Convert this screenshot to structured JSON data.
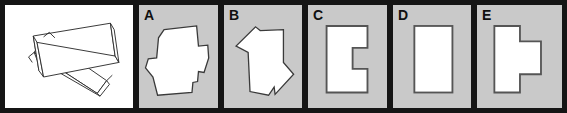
{
  "item": {
    "type": "spatial-reasoning-multiple-choice",
    "stimulus_label": "",
    "panel_count": 6
  },
  "colors": {
    "page_background": "#ffffff",
    "panel_border": "#151515",
    "option_background": "#c9c9c9",
    "shape_fill": "#ffffff",
    "shape_outline": "#3a3a3a",
    "stimulus_outline": "#2b2b2b",
    "label_text": "#101010"
  },
  "panels": [
    {
      "id": "stimulus",
      "label": "",
      "background": "#ffffff",
      "description": "two overlapping tilted flat rectangular sheets drawn in line art with visible thickness"
    },
    {
      "id": "option-a",
      "label": "A",
      "background": "#c9c9c9",
      "description": "irregular cross-like polygon with stepped notches, white fill on gray"
    },
    {
      "id": "option-b",
      "label": "B",
      "background": "#c9c9c9",
      "description": "tall angled polygon with pointed left shoulder and bottom notch, white fill on gray"
    },
    {
      "id": "option-c",
      "label": "C",
      "background": "#c9c9c9",
      "description": "upright rectangle with a square bite removed from the right edge, white fill on gray"
    },
    {
      "id": "option-d",
      "label": "D",
      "background": "#c9c9c9",
      "description": "plain upright rectangle, white fill on gray"
    },
    {
      "id": "option-e",
      "label": "E",
      "background": "#c9c9c9",
      "description": "rectangle with a square tab protruding from the right edge, white fill on gray"
    }
  ]
}
